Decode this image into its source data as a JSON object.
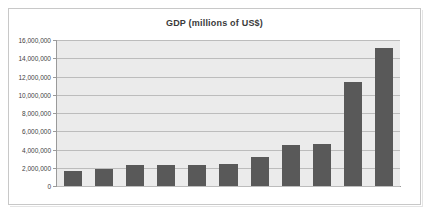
{
  "document": {
    "background_color": "#ffffff",
    "frame_border_color": "#c8c8c8"
  },
  "chart_data": {
    "type": "bar",
    "title": "GDP (millions of US$)",
    "xlabel": "",
    "ylabel": "",
    "ylim": [
      0,
      16000000
    ],
    "y_tick_step": 2000000,
    "y_tick_labels": [
      "16,000,000",
      "14,000,000",
      "12,000,000",
      "10,000,000",
      "8,000,000",
      "6,000,000",
      "4,000,000",
      "2,000,000",
      "0"
    ],
    "y_tick_values": [
      16000000,
      14000000,
      12000000,
      10000000,
      8000000,
      6000000,
      4000000,
      2000000,
      0
    ],
    "grid": true,
    "legend": false,
    "legend_position": "none",
    "bar_color": "#595959",
    "plot_background_color": "#ebebeb",
    "gridline_color": "#bcbcbc",
    "categories": [
      "",
      "",
      "",
      "",
      "",
      "",
      "",
      "",
      "",
      "",
      ""
    ],
    "values": [
      1650000,
      1850000,
      2250000,
      2300000,
      2300000,
      2450000,
      3200000,
      4500000,
      4550000,
      11400000,
      15100000
    ],
    "x_tick_labels_visible": false
  }
}
